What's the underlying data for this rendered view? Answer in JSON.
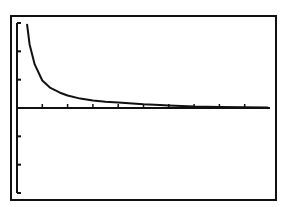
{
  "screen": {
    "background": "#ffffff",
    "ink": "#111111"
  },
  "chart_data": {
    "type": "line",
    "title": "",
    "xlabel": "",
    "ylabel": "",
    "xlim": [
      0,
      10
    ],
    "ylim": [
      -3,
      3
    ],
    "xscl": 1,
    "yscl": 1,
    "grid": false,
    "legend": null,
    "series": [
      {
        "name": "f(x)",
        "x": [
          0.4,
          0.5,
          0.7,
          1.0,
          1.3,
          1.7,
          2.0,
          2.5,
          3.0,
          3.5,
          4.0,
          5.0,
          5.65,
          6.0,
          7.0,
          8.0,
          9.0,
          9.9
        ],
        "y": [
          2.94,
          2.24,
          1.54,
          0.97,
          0.72,
          0.54,
          0.44,
          0.33,
          0.26,
          0.22,
          0.19,
          0.13,
          0.105,
          0.09,
          0.05,
          0.035,
          0.025,
          0.02
        ]
      }
    ]
  }
}
